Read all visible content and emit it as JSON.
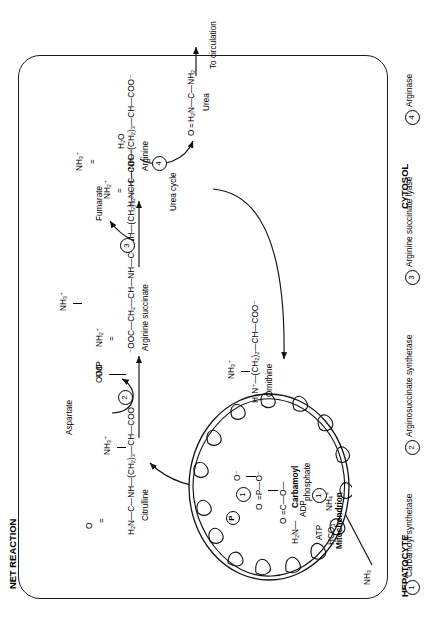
{
  "header": {
    "net_reaction_label": "NET REACTION",
    "net_reaction_equation": "2NH₃ + CO₂ = Urea + H₂O"
  },
  "compartments": {
    "hepatocyte": "HEPATOCYTE",
    "cytosol": "CYTOSOL",
    "mitochondrion": "Mitochondrion"
  },
  "inputs": {
    "ammonia_external": "NH₃",
    "ammonium": "NH₄⁺",
    "atp": "ATP",
    "bicarbonate": "HCO₃⁻",
    "adp": "ADP",
    "phosphate": "P",
    "aspartate": "Aspartate",
    "amp": "AMP",
    "fumarate": "Fumarate",
    "water": "H₂O"
  },
  "metabolites": {
    "carbamoyl_phosphate": {
      "name_line1": "Carbamoyl",
      "name_line2": "phosphate",
      "backbone": "H₂N—C—O—P—O⁻",
      "carbonyl_o": "O",
      "phospho_o_double": "O",
      "phospho_o_top": "O⁻"
    },
    "citrulline": {
      "name": "Citrulline",
      "backbone": "H₂N—C—NH—(CH₂)₃—CH—COO⁻",
      "carbonyl_o": "O",
      "amino": "NH₃⁺"
    },
    "arginine_succinate": {
      "name": "Arginine succinate",
      "backbone": "⁻OOC—CH₂—CH—NH—C—NH—(CH₂)₃—CH—COO⁻",
      "carboxyl_branch": "COO⁻",
      "imino": "NH₂⁺",
      "amino": "NH₃⁺"
    },
    "arginine": {
      "name": "Arginine",
      "backbone": "H₂N—C—NH—(CH₂)₃—CH—COO⁻",
      "imino": "NH₂⁺",
      "amino": "NH₃⁺"
    },
    "ornithine": {
      "name": "Ornithine",
      "backbone": "H₃N⁺—(CH₂)₂—CH—COO⁻",
      "amino": "NH₃⁺"
    },
    "urea": {
      "name": "Urea",
      "backbone": "H₂N—C—NH₂",
      "carbonyl_o": "O"
    }
  },
  "cycle_label": "Urea cycle",
  "output_label": "To circulation",
  "enzymes": [
    {
      "num": "1",
      "name": "Carbamoyl synthetase"
    },
    {
      "num": "2",
      "name": "Arginosuccinate synthetase"
    },
    {
      "num": "3",
      "name": "Arginine succinate lyase"
    },
    {
      "num": "4",
      "name": "Arginase"
    }
  ],
  "reaction_markers": {
    "one": "1",
    "two": "2",
    "three": "3",
    "four": "4"
  },
  "colors": {
    "ink": "#1a1a1a",
    "paper": "#ffffff"
  }
}
